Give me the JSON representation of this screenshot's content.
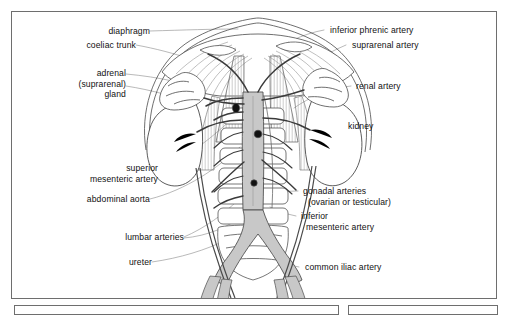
{
  "figure": {
    "type": "anatomical-line-diagram",
    "background_color": "#ffffff",
    "frame_color": "#6e6e6e",
    "vessel_fill_color": "#c8c8c8",
    "line_color": "#3a3a3a",
    "leader_line_color": "#8a8a8a"
  },
  "labels_left": [
    {
      "id": "diaphragm",
      "text": "diaphragm",
      "lines": [
        "diaphragm"
      ]
    },
    {
      "id": "coeliac-trunk",
      "text": "coeliac trunk",
      "lines": [
        "coeliac trunk"
      ]
    },
    {
      "id": "adrenal-gland",
      "text": "adrenal (suprarenal) gland",
      "lines": [
        "adrenal",
        "(suprarenal)",
        "gland"
      ]
    },
    {
      "id": "superior-mesenteric-artery",
      "text": "superior mesenteric artery",
      "lines": [
        "superior",
        "mesenteric artery"
      ]
    },
    {
      "id": "abdominal-aorta",
      "text": "abdominal aorta",
      "lines": [
        "abdominal aorta"
      ]
    },
    {
      "id": "lumbar-arteries",
      "text": "lumbar arteries",
      "lines": [
        "lumbar arteries"
      ]
    },
    {
      "id": "ureter",
      "text": "ureter",
      "lines": [
        "ureter"
      ]
    }
  ],
  "labels_right": [
    {
      "id": "inferior-phrenic-artery",
      "text": "inferior phrenic artery",
      "lines": [
        "inferior phrenic artery"
      ]
    },
    {
      "id": "suprarenal-artery",
      "text": "suprarenal artery",
      "lines": [
        "suprarenal artery"
      ]
    },
    {
      "id": "renal-artery",
      "text": "renal artery",
      "lines": [
        "renal artery"
      ]
    },
    {
      "id": "kidney",
      "text": "kidney",
      "lines": [
        "kidney"
      ]
    },
    {
      "id": "gonadal-arteries",
      "text": "gonadal arteries (ovarian or testicular)",
      "lines": [
        "gonadal arteries",
        "(ovarian or testicular)"
      ]
    },
    {
      "id": "inferior-mesenteric-artery",
      "text": "inferior mesenteric artery",
      "lines": [
        "inferior",
        "mesenteric artery"
      ]
    },
    {
      "id": "common-iliac-artery",
      "text": "common iliac artery",
      "lines": [
        "common iliac artery"
      ]
    }
  ]
}
